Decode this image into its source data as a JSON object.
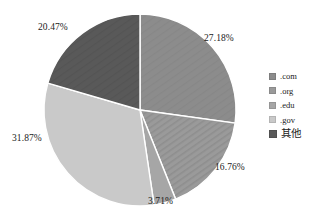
{
  "chart_data": {
    "type": "pie",
    "title": "",
    "subtitle": "",
    "xlabel": "",
    "ylabel": "",
    "grid": false,
    "legend_position": "right",
    "start_angle_deg": 0,
    "direction": "clockwise",
    "categories": [
      ".com",
      ".org",
      ".edu",
      ".gov",
      "其他"
    ],
    "values": [
      27.18,
      16.76,
      3.71,
      31.87,
      20.47
    ],
    "value_unit": "%",
    "data_labels": [
      "27.18%",
      "16.76%",
      "3.71%",
      "31.87%",
      "20.47%"
    ],
    "colors": [
      "#8c8c8c",
      "#9a9a9a",
      "#a6a6a6",
      "#c9c9c9",
      "#595959"
    ],
    "slice_border_color": "#ffffff",
    "slices": [
      {
        "label": ".com",
        "value": 27.18,
        "data_label": "27.18%",
        "color": "#8c8c8c",
        "pattern": "solid"
      },
      {
        "label": ".org",
        "value": 16.76,
        "data_label": "16.76%",
        "color": "#9a9a9a",
        "pattern": "diagonal-stripes"
      },
      {
        "label": ".edu",
        "value": 3.71,
        "data_label": "3.71%",
        "color": "#a6a6a6",
        "pattern": "solid"
      },
      {
        "label": ".gov",
        "value": 31.87,
        "data_label": "31.87%",
        "color": "#c9c9c9",
        "pattern": "solid"
      },
      {
        "label": "其他",
        "value": 20.47,
        "data_label": "20.47%",
        "color": "#595959",
        "pattern": "solid"
      }
    ]
  },
  "legend": {
    "items": [
      {
        "label": ".com",
        "color": "#8c8c8c"
      },
      {
        "label": ".org",
        "color": "#9a9a9a"
      },
      {
        "label": ".edu",
        "color": "#a6a6a6"
      },
      {
        "label": ".gov",
        "color": "#c9c9c9"
      },
      {
        "label": "其他",
        "color": "#595959"
      }
    ]
  },
  "labels": {
    "com": "27.18%",
    "org": "16.76%",
    "edu": "3.71%",
    "gov": "31.87%",
    "other": "20.47%"
  }
}
